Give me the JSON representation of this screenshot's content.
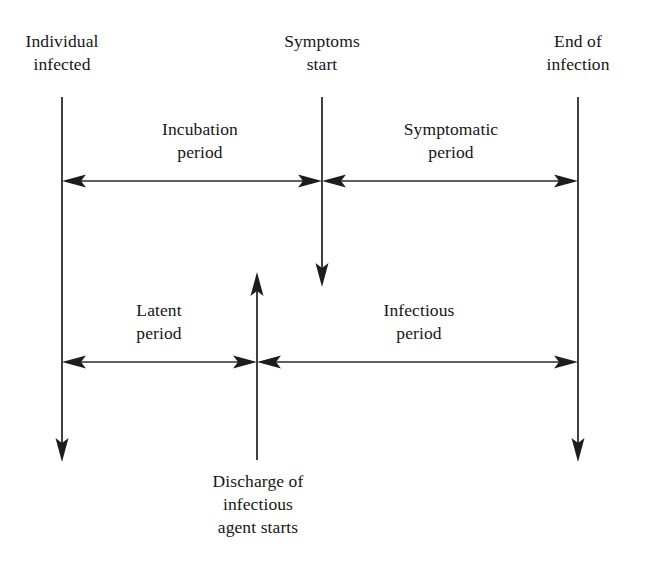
{
  "figure": {
    "type": "timeline-diagram",
    "background_color": "#ffffff",
    "stroke_color": "#2b2b2b"
  },
  "events": [
    {
      "id": "individual-infected",
      "label": "Individual\ninfected",
      "x": 62,
      "label_x": 62,
      "label_y": 30,
      "line": {
        "x": 62,
        "y_start": 97,
        "y_end": 460,
        "arrow": "down"
      }
    },
    {
      "id": "symptoms-start",
      "label": "Symptoms\nstart",
      "x": 322,
      "label_x": 322,
      "label_y": 30,
      "line": {
        "x": 322,
        "y_start": 97,
        "y_end": 285,
        "arrow": "down"
      }
    },
    {
      "id": "end-of-infection",
      "label": "End of\ninfection",
      "x": 578,
      "label_x": 578,
      "label_y": 30,
      "line": {
        "x": 578,
        "y_start": 97,
        "y_end": 460,
        "arrow": "down"
      }
    },
    {
      "id": "discharge-of-infectious-agent-starts",
      "label": "Discharge of\ninfectious\nagent starts",
      "x": 257,
      "label_x": 258,
      "label_y": 470,
      "line": {
        "x": 257,
        "y_start": 273,
        "y_end": 460,
        "arrow": "up"
      }
    }
  ],
  "periods": [
    {
      "id": "incubation-period",
      "label": "Incubation\nperiod",
      "label_x": 200,
      "label_y": 118,
      "arrow": {
        "x1": 62,
        "x2": 322,
        "y": 181,
        "heads": "both"
      }
    },
    {
      "id": "symptomatic-period",
      "label": "Symptomatic\nperiod",
      "label_x": 451,
      "label_y": 118,
      "arrow": {
        "x1": 322,
        "x2": 578,
        "y": 181,
        "heads": "both"
      }
    },
    {
      "id": "latent-period",
      "label": "Latent\nperiod",
      "label_x": 159,
      "label_y": 299,
      "arrow": {
        "x1": 62,
        "x2": 257,
        "y": 362,
        "heads": "both"
      }
    },
    {
      "id": "infectious-period",
      "label": "Infectious\nperiod",
      "label_x": 419,
      "label_y": 299,
      "arrow": {
        "x1": 257,
        "x2": 578,
        "y": 362,
        "heads": "both"
      }
    }
  ]
}
